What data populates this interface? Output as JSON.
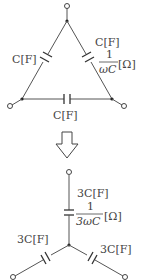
{
  "delta": {
    "left_cap": "C[F]",
    "right_cap": "C[F]",
    "right_impedance_num": "1",
    "right_impedance_den": "ωC",
    "right_impedance_unit": "[Ω]",
    "bottom_cap": "C[F]"
  },
  "star": {
    "top_cap": "3C[F]",
    "top_impedance_num": "1",
    "top_impedance_den": "3ωC",
    "top_impedance_unit": "[Ω]",
    "left_cap": "3C[F]",
    "right_cap": "3C[F]"
  },
  "arrow": "down"
}
